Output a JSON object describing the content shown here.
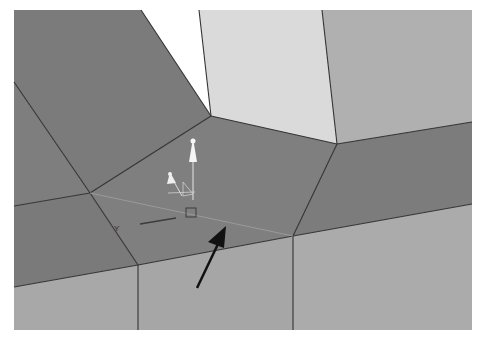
{
  "viewport": {
    "type": "3d-mesh-viewport",
    "background": "#ffffff",
    "colors": {
      "dark_face": "#7a7a7a",
      "mid_face": "#a9a9a9",
      "light_face": "#dcdcdc",
      "right_face": "#b2b2b2",
      "edge": "#3a3a3a",
      "gizmo": "#f2f2f2",
      "arrow": "#111111"
    }
  },
  "gizmo": {
    "axis_label": "Y"
  },
  "annotation": {
    "type": "arrow",
    "pointing_to": "selected-edge"
  }
}
